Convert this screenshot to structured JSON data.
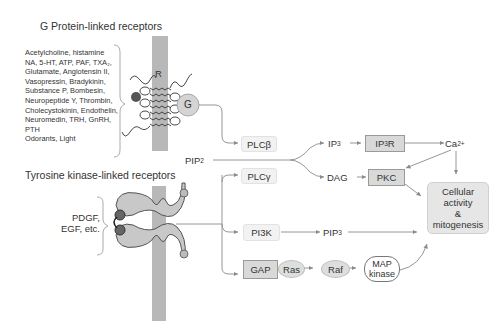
{
  "titles": {
    "g_protein": "G Protein-linked receptors",
    "tyrosine_kinase": "Tyrosine kinase-linked receptors"
  },
  "g_protein_ligands": [
    "Acetylcholine, histamine",
    "NA, 5-HT, ATP, PAF, TXA₂,",
    "Glutamate, Angiotensin II,",
    "Vasopressin, Bradykinin,",
    "Substance P, Bombesin,",
    "Neuropeptide Y, Thrombin,",
    "Cholecystokinin, Endothelin,",
    "Neuromedin, TRH, GnRH,",
    "PTH",
    "Odorants, Light"
  ],
  "tk_ligands": [
    "PDGF,",
    "EGF, etc."
  ],
  "receptor_labels": {
    "r": "R",
    "g": "G"
  },
  "nodes": {
    "plcb": "PLCβ",
    "plcg": "PLCγ",
    "pip2": {
      "base": "PIP",
      "sub": "2"
    },
    "ip3": {
      "base": "IP",
      "sub": "3"
    },
    "ip3r": {
      "base": "IP",
      "sub": "3",
      "tail": "R"
    },
    "ca": {
      "base": "Ca",
      "sup": "2+"
    },
    "dag": "DAG",
    "pkc": "PKC",
    "pi3k": "PI3K",
    "pip3": {
      "base": "PIP",
      "sub": "3"
    },
    "gap": "GAP",
    "ras": "Ras",
    "raf": "Raf",
    "map": [
      "MAP",
      "kinase"
    ],
    "outcome": [
      "Cellular",
      "activity",
      "&",
      "mitogenesis"
    ]
  },
  "colors": {
    "membrane": "#b8b8b8",
    "arrow": "#8a8a8a",
    "box_dark": "#d9d9d9",
    "text": "#333333"
  }
}
